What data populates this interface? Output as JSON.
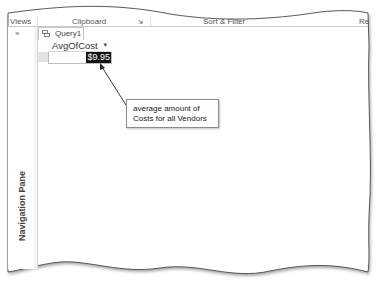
{
  "ribbon": {
    "groups": [
      {
        "label": "Views"
      },
      {
        "label": "Clipboard"
      },
      {
        "label": "Sort & Filter"
      },
      {
        "label": "Re"
      }
    ],
    "dialog_launcher_icon": "dialog-launcher-icon"
  },
  "nav_pane": {
    "toggle_label": "»",
    "label": "Navigation Pane"
  },
  "document_tab": {
    "icon": "query-icon",
    "label": "Query1"
  },
  "datasheet": {
    "columns": [
      {
        "header": "AvgOfCost",
        "dropdown_icon": "▾"
      }
    ],
    "rows": [
      [
        "$9.95"
      ]
    ]
  },
  "callout": {
    "line1": "average amount of",
    "line2": "Costs for all Vendors"
  },
  "colors": {
    "selection_bg": "#111111",
    "selection_fg": "#ffffff",
    "border": "#c6c6c6",
    "callout_border": "#8c8c8c"
  }
}
